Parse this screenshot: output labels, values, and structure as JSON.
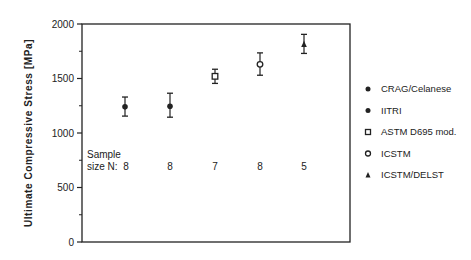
{
  "chart_data": {
    "type": "scatter",
    "title": "",
    "xlabel": "",
    "ylabel": "Ultimate   Compressive   Stress   [MPa]",
    "ylim": [
      0,
      2000
    ],
    "yticks": [
      0,
      500,
      1000,
      1500,
      2000
    ],
    "grid": false,
    "legend_position": "right",
    "sample_size_label_line1": "Sample",
    "sample_size_label_line2": "size N:",
    "series": [
      {
        "name": "CRAG/Celanese",
        "marker": "filled-circle",
        "value": 1240,
        "error_low": 1155,
        "error_high": 1330,
        "n": "8"
      },
      {
        "name": "IITRI",
        "marker": "filled-circle",
        "value": 1245,
        "error_low": 1145,
        "error_high": 1365,
        "n": "8"
      },
      {
        "name": "ASTM D695 mod.",
        "marker": "open-square",
        "value": 1520,
        "error_low": 1455,
        "error_high": 1585,
        "n": "7"
      },
      {
        "name": "ICSTM",
        "marker": "open-circle",
        "value": 1630,
        "error_low": 1530,
        "error_high": 1735,
        "n": "8"
      },
      {
        "name": "ICSTM/DELST",
        "marker": "filled-triangle",
        "value": 1815,
        "error_low": 1730,
        "error_high": 1905,
        "n": "5"
      }
    ]
  }
}
